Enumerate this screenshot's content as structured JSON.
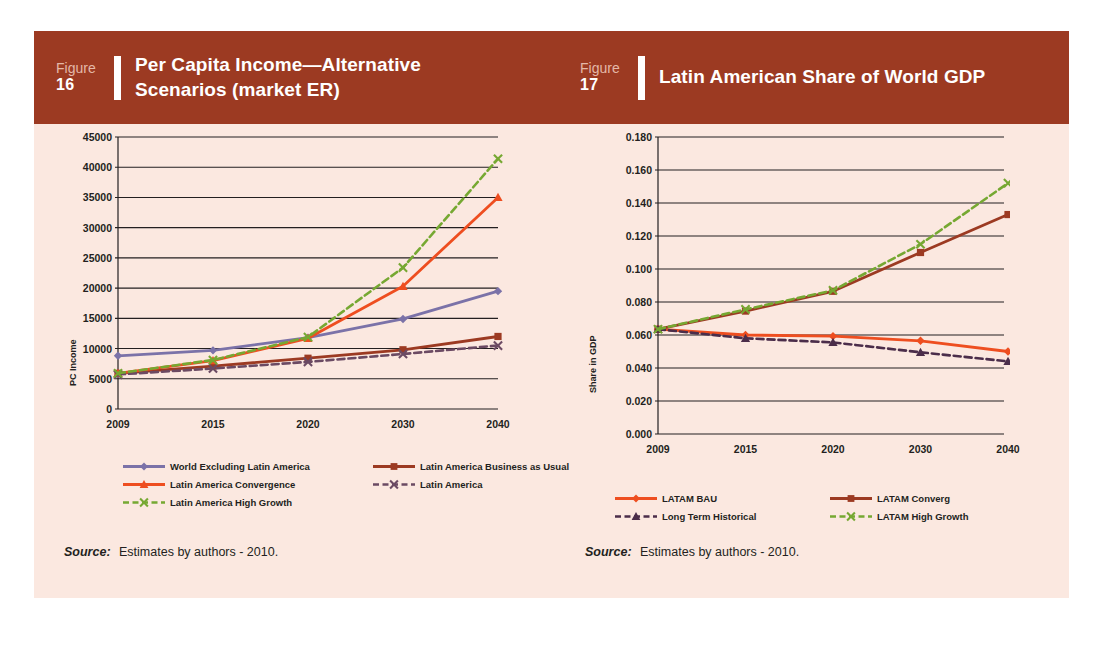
{
  "page": {
    "background": "#ffffff",
    "card_background": "#fbe8e0",
    "header_color": "#9c3a22"
  },
  "figures": [
    {
      "figure_word": "Figure",
      "number": "16",
      "title": "Per Capita Income—Alternative Scenarios (market ER)",
      "source_label": "Source:",
      "source_text": "Estimates by authors - 2010."
    },
    {
      "figure_word": "Figure",
      "number": "17",
      "title": "Latin American Share of World GDP",
      "source_label": "Source:",
      "source_text": "Estimates by authors - 2010."
    }
  ],
  "chart_data": [
    {
      "type": "line",
      "title": "Per Capita Income—Alternative Scenarios (market ER)",
      "xlabel": "",
      "ylabel": "PC Income",
      "categories": [
        "2009",
        "2015",
        "2020",
        "2030",
        "2040"
      ],
      "ylim": [
        0,
        45000
      ],
      "yticks": [
        0,
        5000,
        10000,
        15000,
        20000,
        25000,
        30000,
        35000,
        40000,
        45000
      ],
      "ytick_labels": [
        "0",
        "5000",
        "10000",
        "15000",
        "20000",
        "25000",
        "30000",
        "35000",
        "40000",
        "45000"
      ],
      "grid": true,
      "legend_position": "bottom",
      "series": [
        {
          "name": "World Excluding Latin America",
          "color": "#7b72a8",
          "marker": "diamond",
          "dash": "solid",
          "values": [
            8800,
            9700,
            11800,
            14900,
            19500
          ]
        },
        {
          "name": "Latin America Business as Usual",
          "color": "#9c3a22",
          "marker": "square",
          "dash": "solid",
          "values": [
            5900,
            7100,
            8400,
            9800,
            12000
          ]
        },
        {
          "name": "Latin America Convergence",
          "color": "#ee4e20",
          "marker": "triangle",
          "dash": "solid",
          "values": [
            5900,
            8000,
            11700,
            20300,
            35000
          ]
        },
        {
          "name": "Latin America",
          "color": "#6b4a63",
          "marker": "x",
          "dash": "dashed",
          "values": [
            5700,
            6700,
            7800,
            9100,
            10500
          ]
        },
        {
          "name": "Latin America High Growth",
          "color": "#76a832",
          "marker": "x",
          "dash": "dashed",
          "values": [
            5900,
            8100,
            11900,
            23400,
            41400
          ]
        }
      ]
    },
    {
      "type": "line",
      "title": "Latin American Share of World GDP",
      "xlabel": "",
      "ylabel": "Share in GDP",
      "categories": [
        "2009",
        "2015",
        "2020",
        "2030",
        "2040"
      ],
      "ylim": [
        0.0,
        0.18
      ],
      "yticks": [
        0.0,
        0.02,
        0.04,
        0.06,
        0.08,
        0.1,
        0.12,
        0.14,
        0.16,
        0.18
      ],
      "ytick_labels": [
        "0.000",
        "0.020",
        "0.040",
        "0.060",
        "0.080",
        "0.100",
        "0.120",
        "0.140",
        "0.160",
        "0.180"
      ],
      "grid": true,
      "legend_position": "bottom",
      "series": [
        {
          "name": "LATAM BAU",
          "color": "#ee4e20",
          "marker": "diamond",
          "dash": "solid",
          "values": [
            0.0635,
            0.06,
            0.0593,
            0.0565,
            0.05
          ]
        },
        {
          "name": "LATAM Converg",
          "color": "#9c3a22",
          "marker": "square",
          "dash": "solid",
          "values": [
            0.0635,
            0.0745,
            0.0865,
            0.11,
            0.133
          ]
        },
        {
          "name": "Long Term Historical",
          "color": "#4b2d4a",
          "marker": "triangle",
          "dash": "dashed",
          "values": [
            0.0635,
            0.058,
            0.0555,
            0.0495,
            0.044
          ]
        },
        {
          "name": "LATAM High Growth",
          "color": "#76a832",
          "marker": "x",
          "dash": "dashed",
          "values": [
            0.0635,
            0.0755,
            0.087,
            0.115,
            0.152
          ]
        }
      ]
    }
  ]
}
